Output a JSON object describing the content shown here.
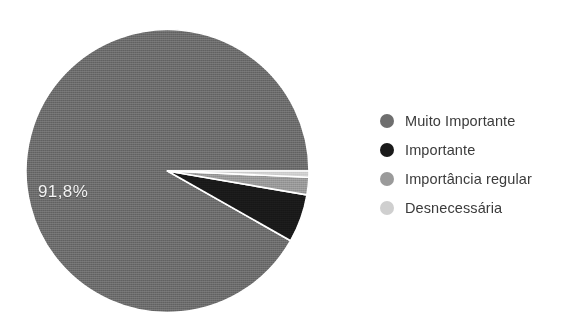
{
  "chart_data": {
    "type": "pie",
    "title": "",
    "subtitle": "",
    "xlabel": "",
    "ylabel": "",
    "legend_position": "right",
    "grid": false,
    "units": "percent",
    "decimal_separator": ",",
    "categories": [
      "Muito Importante",
      "Importante",
      "Importância regular",
      "Desnecessária"
    ],
    "values": [
      91.8,
      5.5,
      2.0,
      0.7
    ],
    "colors": [
      "#6e6e6e",
      "#1a1a1a",
      "#9a9a9a",
      "#cfcfcf"
    ],
    "data_labels": [
      "91,8%",
      "",
      "",
      ""
    ],
    "visible_data_labels": [
      "91,8%"
    ],
    "start_angle_deg": 0,
    "direction": "counterclockwise",
    "slices": [
      {
        "label": "Muito Importante",
        "value": 91.8,
        "display": "91,8%",
        "color": "#6e6e6e",
        "label_shown": true
      },
      {
        "label": "Importante",
        "value": 5.5,
        "display": "",
        "color": "#1a1a1a",
        "label_shown": false
      },
      {
        "label": "Importância regular",
        "value": 2.0,
        "display": "",
        "color": "#9a9a9a",
        "label_shown": false
      },
      {
        "label": "Desnecessária",
        "value": 0.7,
        "display": "",
        "color": "#cfcfcf",
        "label_shown": false
      }
    ]
  },
  "pie": {
    "main_label": "91,8%"
  },
  "legend": {
    "items": [
      {
        "label": "Muito Importante",
        "color": "#6e6e6e"
      },
      {
        "label": "Importante",
        "color": "#1a1a1a"
      },
      {
        "label": "Importância regular",
        "color": "#9a9a9a"
      },
      {
        "label": "Desnecessária",
        "color": "#cfcfcf"
      }
    ]
  },
  "colors": {
    "background": "#ffffff",
    "text": "#3b3b3b",
    "label_text": "#f2f2f2",
    "slice_separator": "#ffffff"
  }
}
